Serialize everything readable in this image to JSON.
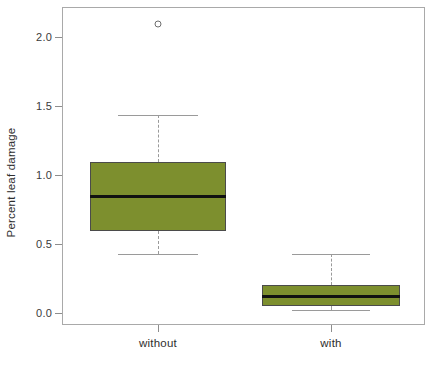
{
  "chart_data": {
    "type": "box",
    "title": "",
    "xlabel": "",
    "ylabel": "Percent leaf damage",
    "ylim": [
      -0.1,
      2.15
    ],
    "grid": false,
    "legend": "none",
    "y_ticks": [
      "0.0",
      "0.5",
      "1.0",
      "1.5",
      "2.0"
    ],
    "y_tick_values": [
      0.0,
      0.5,
      1.0,
      1.5,
      2.0
    ],
    "categories": [
      "without",
      "with"
    ],
    "boxes": [
      {
        "label": "without",
        "whisker_low": 0.43,
        "q1": 0.59,
        "median": 0.84,
        "q3": 1.09,
        "whisker_high": 1.43,
        "outliers": [
          2.09
        ]
      },
      {
        "label": "with",
        "whisker_low": 0.02,
        "q1": 0.05,
        "median": 0.12,
        "q3": 0.2,
        "whisker_high": 0.43,
        "outliers": []
      }
    ]
  },
  "style": {
    "box_fill": "#7d8f2e",
    "box_border": "#4b4b4b",
    "median_color": "#111111",
    "whisker_color": "#9a9a9a",
    "frame_color": "#a9a9a9",
    "background": "#ffffff"
  },
  "axis": {
    "y_title": "Percent leaf damage"
  }
}
